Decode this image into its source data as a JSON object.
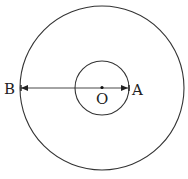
{
  "diagram": {
    "type": "concentric-circles",
    "center": {
      "label": "O",
      "x": 102,
      "y": 88
    },
    "outer_circle": {
      "r": 82
    },
    "inner_circle": {
      "r": 27
    },
    "points": [
      {
        "label": "B",
        "x": 20,
        "y": 88,
        "on": "outer_circle"
      },
      {
        "label": "A",
        "x": 129,
        "y": 88,
        "on": "inner_circle"
      }
    ],
    "segment": {
      "from": "B",
      "to": "A",
      "style": "double-arrow"
    },
    "stroke_color": "#333333"
  }
}
